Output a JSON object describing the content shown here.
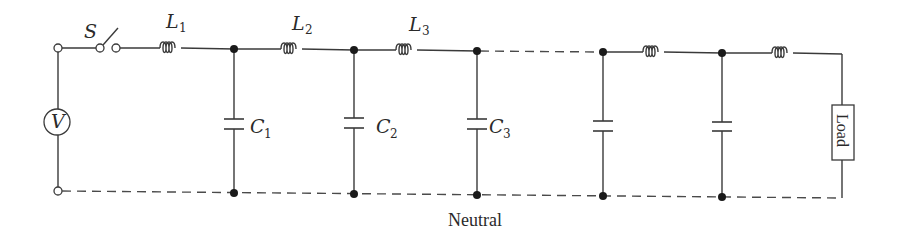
{
  "diagram": {
    "title": "",
    "colors": {
      "wire": "#3a3a3a",
      "node": "#1a1a1a",
      "background": "#ffffff"
    },
    "source": {
      "label": "V",
      "symbol": "voltage-source"
    },
    "switch": {
      "label": "S"
    },
    "inductors": [
      {
        "label": "L",
        "subscript": "1"
      },
      {
        "label": "L",
        "subscript": "2"
      },
      {
        "label": "L",
        "subscript": "3"
      },
      {
        "label": "",
        "subscript": ""
      },
      {
        "label": "",
        "subscript": ""
      }
    ],
    "capacitors": [
      {
        "label": "C",
        "subscript": "1"
      },
      {
        "label": "C",
        "subscript": "2"
      },
      {
        "label": "C",
        "subscript": "3"
      },
      {
        "label": "",
        "subscript": ""
      },
      {
        "label": "",
        "subscript": ""
      }
    ],
    "load": {
      "label": "Load"
    },
    "neutral": {
      "label": "Neutral"
    }
  }
}
